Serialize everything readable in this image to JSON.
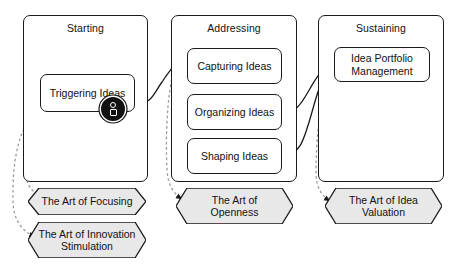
{
  "diagram": {
    "colors": {
      "stroke": "#1a1a1a",
      "fill": "#ffffff",
      "hex_fill": "#e8e8e8",
      "dashed": "#9a9a9a",
      "text": "#111111"
    },
    "phases": [
      {
        "id": "starting",
        "label": "Starting",
        "activities": [
          {
            "id": "triggering-ideas",
            "label": "Triggering Ideas",
            "badge": "person-icon"
          }
        ]
      },
      {
        "id": "addressing",
        "label": "Addressing",
        "activities": [
          {
            "id": "capturing-ideas",
            "label": "Capturing Ideas"
          },
          {
            "id": "organizing-ideas",
            "label": "Organizing Ideas"
          },
          {
            "id": "shaping-ideas",
            "label": "Shaping Ideas"
          }
        ]
      },
      {
        "id": "sustaining",
        "label": "Sustaining",
        "activities": [
          {
            "id": "idea-portfolio-management",
            "label": "Idea Portfolio\nManagement"
          }
        ]
      }
    ],
    "arts": [
      {
        "id": "art-of-focusing",
        "label": "The Art of Focusing"
      },
      {
        "id": "art-of-innovation-stimulation",
        "label": "The Art of Innovation\nStimulation"
      },
      {
        "id": "art-of-openness",
        "label": "The Art of\nOpenness"
      },
      {
        "id": "art-of-idea-valuation",
        "label": "The Art of Idea\nValuation"
      }
    ]
  }
}
